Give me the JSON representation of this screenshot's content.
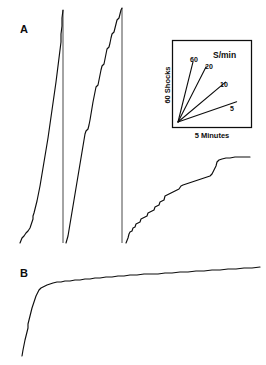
{
  "figure": {
    "panels": [
      {
        "id": "A",
        "label": "A"
      },
      {
        "id": "B",
        "label": "B"
      }
    ]
  },
  "inset": {
    "header": "S/min",
    "y_axis_label": "60 Shocks",
    "x_axis_label": "5 Minutes",
    "slope_labels": [
      "60",
      "20",
      "10",
      "5"
    ]
  },
  "chart_data": {
    "type": "line",
    "title": "",
    "subtitle": "",
    "xlabel": "5 Minutes",
    "ylabel": "60 Shocks",
    "grid": false,
    "legend_position": "inset-upper-right",
    "axis_units": {
      "x": "minutes",
      "y": "shocks",
      "x_scale_bar_minutes": 5,
      "y_scale_bar_shocks": 60
    },
    "inset_slope_reference": {
      "type": "line",
      "units": "responses per minute",
      "series": [
        {
          "name": "60",
          "rate_per_min": 60,
          "angle_deg": 76
        },
        {
          "name": "20",
          "rate_per_min": 20,
          "angle_deg": 63
        },
        {
          "name": "10",
          "rate_per_min": 10,
          "angle_deg": 40
        },
        {
          "name": "5",
          "rate_per_min": 5,
          "angle_deg": 19
        }
      ]
    },
    "series": [
      {
        "name": "A1",
        "panel": "A",
        "note": "positively accelerated cumulative record ending in pen reset",
        "points": [
          [
            20,
            243
          ],
          [
            22,
            238
          ],
          [
            24,
            236
          ],
          [
            26,
            233
          ],
          [
            28,
            231
          ],
          [
            30,
            228
          ],
          [
            31,
            225
          ],
          [
            32,
            222
          ],
          [
            33,
            219
          ],
          [
            33,
            216
          ],
          [
            34,
            213
          ],
          [
            35,
            209
          ],
          [
            36,
            205
          ],
          [
            37,
            201
          ],
          [
            38,
            196
          ],
          [
            39,
            191
          ],
          [
            40,
            186
          ],
          [
            41,
            180
          ],
          [
            42,
            174
          ],
          [
            43,
            168
          ],
          [
            44,
            162
          ],
          [
            45,
            156
          ],
          [
            46,
            150
          ],
          [
            47,
            144
          ],
          [
            48,
            138
          ],
          [
            49,
            131
          ],
          [
            50,
            124
          ],
          [
            51,
            117
          ],
          [
            52,
            110
          ],
          [
            53,
            103
          ],
          [
            54,
            96
          ],
          [
            55,
            89
          ],
          [
            56,
            82
          ],
          [
            57,
            74
          ],
          [
            58,
            66
          ],
          [
            59,
            58
          ],
          [
            60,
            50
          ],
          [
            61,
            42
          ],
          [
            61,
            34
          ],
          [
            62,
            26
          ],
          [
            62,
            18
          ],
          [
            63,
            10
          ]
        ]
      },
      {
        "name": "A2",
        "panel": "A",
        "note": "approximately constant high rate, slight step irregularities, ends in pen reset",
        "points": [
          [
            66,
            243
          ],
          [
            68,
            236
          ],
          [
            69,
            230
          ],
          [
            70,
            224
          ],
          [
            71,
            218
          ],
          [
            72,
            212
          ],
          [
            73,
            206
          ],
          [
            74,
            200
          ],
          [
            75,
            194
          ],
          [
            76,
            188
          ],
          [
            77,
            182
          ],
          [
            78,
            176
          ],
          [
            79,
            170
          ],
          [
            80,
            164
          ],
          [
            81,
            158
          ],
          [
            82,
            152
          ],
          [
            83,
            146
          ],
          [
            84,
            140
          ],
          [
            85,
            134
          ],
          [
            86,
            131
          ],
          [
            88,
            129
          ],
          [
            89,
            125
          ],
          [
            90,
            120
          ],
          [
            91,
            114
          ],
          [
            92,
            108
          ],
          [
            93,
            102
          ],
          [
            94,
            97
          ],
          [
            95,
            92
          ],
          [
            96,
            87
          ],
          [
            98,
            85
          ],
          [
            99,
            80
          ],
          [
            100,
            75
          ],
          [
            101,
            70
          ],
          [
            102,
            66
          ],
          [
            104,
            64
          ],
          [
            105,
            59
          ],
          [
            106,
            54
          ],
          [
            107,
            49
          ],
          [
            109,
            47
          ],
          [
            110,
            43
          ],
          [
            111,
            38
          ],
          [
            112,
            34
          ],
          [
            114,
            32
          ],
          [
            115,
            28
          ],
          [
            116,
            24
          ],
          [
            117,
            20
          ],
          [
            119,
            18
          ],
          [
            120,
            14
          ],
          [
            121,
            10
          ],
          [
            122,
            8
          ]
        ]
      },
      {
        "name": "A3",
        "panel": "A",
        "note": "low overall rate with pronounced stair-step pauses, terminal acceleration",
        "points": [
          [
            126,
            243
          ],
          [
            128,
            238
          ],
          [
            129,
            234
          ],
          [
            130,
            232
          ],
          [
            132,
            231
          ],
          [
            133,
            228
          ],
          [
            135,
            227
          ],
          [
            136,
            224
          ],
          [
            138,
            223
          ],
          [
            140,
            222
          ],
          [
            141,
            219
          ],
          [
            143,
            218
          ],
          [
            145,
            217
          ],
          [
            147,
            216
          ],
          [
            148,
            213
          ],
          [
            150,
            212
          ],
          [
            152,
            211
          ],
          [
            154,
            210
          ],
          [
            155,
            207
          ],
          [
            157,
            206
          ],
          [
            159,
            205
          ],
          [
            160,
            202
          ],
          [
            162,
            201
          ],
          [
            164,
            200
          ],
          [
            165,
            196
          ],
          [
            167,
            195
          ],
          [
            169,
            194
          ],
          [
            171,
            193
          ],
          [
            173,
            192
          ],
          [
            175,
            191
          ],
          [
            177,
            190
          ],
          [
            179,
            189
          ],
          [
            181,
            186
          ],
          [
            183,
            185
          ],
          [
            186,
            184
          ],
          [
            189,
            183
          ],
          [
            192,
            182
          ],
          [
            195,
            181
          ],
          [
            198,
            180
          ],
          [
            201,
            179
          ],
          [
            204,
            178
          ],
          [
            207,
            177
          ],
          [
            210,
            176
          ],
          [
            212,
            174
          ],
          [
            214,
            170
          ],
          [
            216,
            166
          ],
          [
            217,
            162
          ],
          [
            219,
            160
          ],
          [
            222,
            159
          ],
          [
            226,
            158
          ],
          [
            230,
            158
          ],
          [
            235,
            157
          ],
          [
            240,
            157
          ],
          [
            245,
            157
          ],
          [
            250,
            157
          ]
        ]
      },
      {
        "name": "B1",
        "panel": "B",
        "note": "negatively accelerated cumulative curve: steep onset then long near-flat plateau",
        "points": [
          [
            22,
            356
          ],
          [
            23,
            350
          ],
          [
            24,
            345
          ],
          [
            25,
            340
          ],
          [
            26,
            336
          ],
          [
            27,
            332
          ],
          [
            28,
            328
          ],
          [
            28,
            324
          ],
          [
            29,
            320
          ],
          [
            30,
            316
          ],
          [
            31,
            312
          ],
          [
            32,
            308
          ],
          [
            33,
            305
          ],
          [
            34,
            302
          ],
          [
            35,
            299
          ],
          [
            36,
            296
          ],
          [
            37,
            294
          ],
          [
            38,
            292
          ],
          [
            39,
            290
          ],
          [
            41,
            288
          ],
          [
            43,
            287
          ],
          [
            45,
            286
          ],
          [
            47,
            285
          ],
          [
            50,
            284
          ],
          [
            53,
            283
          ],
          [
            57,
            282
          ],
          [
            61,
            282
          ],
          [
            65,
            281
          ],
          [
            70,
            281
          ],
          [
            75,
            280
          ],
          [
            80,
            280
          ],
          [
            85,
            279
          ],
          [
            90,
            279
          ],
          [
            95,
            278
          ],
          [
            100,
            278
          ],
          [
            106,
            277
          ],
          [
            112,
            277
          ],
          [
            118,
            276
          ],
          [
            124,
            276
          ],
          [
            130,
            275
          ],
          [
            137,
            275
          ],
          [
            144,
            274
          ],
          [
            151,
            274
          ],
          [
            158,
            274
          ],
          [
            165,
            273
          ],
          [
            172,
            273
          ],
          [
            180,
            272
          ],
          [
            188,
            272
          ],
          [
            196,
            271
          ],
          [
            204,
            271
          ],
          [
            212,
            270
          ],
          [
            220,
            270
          ],
          [
            228,
            269
          ],
          [
            236,
            269
          ],
          [
            244,
            268
          ],
          [
            252,
            268
          ],
          [
            260,
            267
          ]
        ]
      }
    ],
    "pen_resets": [
      {
        "panel": "A",
        "x": 63,
        "y_top": 10,
        "y_bottom": 243
      },
      {
        "panel": "A",
        "x": 122,
        "y_top": 8,
        "y_bottom": 243
      }
    ]
  }
}
